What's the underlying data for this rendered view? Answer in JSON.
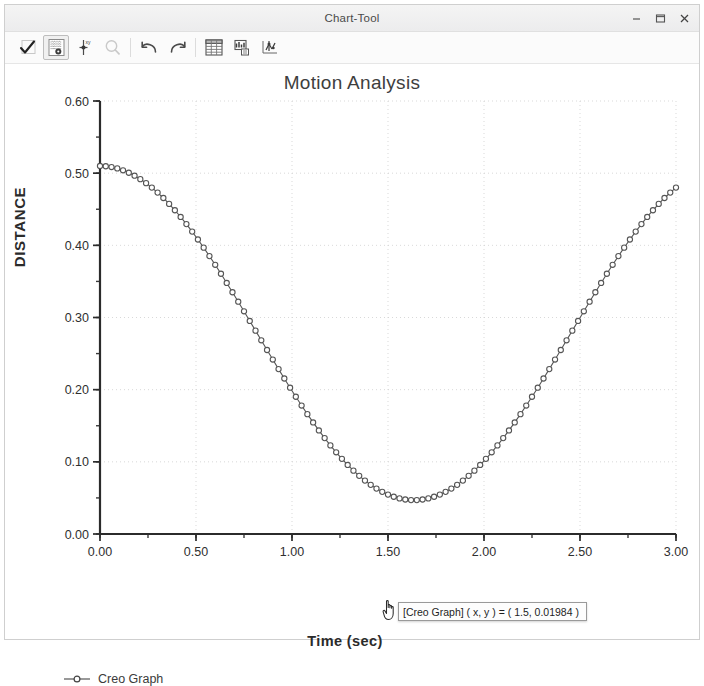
{
  "window": {
    "title": "Chart-Tool",
    "controls": [
      {
        "name": "minimize-button",
        "glyph": "minimize"
      },
      {
        "name": "maximize-button",
        "glyph": "maximize"
      },
      {
        "name": "close-button",
        "glyph": "close"
      }
    ]
  },
  "toolbar": {
    "buttons": [
      {
        "name": "accept-check-button",
        "icon": "checkmark-icon",
        "state": "normal"
      },
      {
        "name": "graph-display-settings-button",
        "icon": "grid-settings-icon",
        "state": "active"
      },
      {
        "name": "add-marker-button",
        "icon": "marker-pin-icon",
        "state": "normal"
      },
      {
        "name": "zoom-button",
        "icon": "magnifier-icon",
        "state": "disabled"
      },
      {
        "name": "undo-button",
        "icon": "undo-arrow-icon",
        "state": "normal"
      },
      {
        "name": "redo-button",
        "icon": "redo-arrow-icon",
        "state": "normal"
      },
      {
        "name": "show-table-button",
        "icon": "table-icon",
        "state": "normal"
      },
      {
        "name": "chart-format-button",
        "icon": "chart-format-icon",
        "state": "normal"
      },
      {
        "name": "export-data-button",
        "icon": "export-scatter-icon",
        "state": "normal"
      }
    ]
  },
  "chart_data": {
    "type": "line",
    "title": "Motion Analysis",
    "xlabel": "Time (sec)",
    "ylabel": "DISTANCE",
    "xlim": [
      0,
      3
    ],
    "ylim": [
      0,
      0.6
    ],
    "xticks": [
      "0.00",
      "0.50",
      "1.00",
      "1.50",
      "2.00",
      "2.50",
      "3.00"
    ],
    "xtick_values": [
      0,
      0.5,
      1,
      1.5,
      2,
      2.5,
      3
    ],
    "yticks": [
      "0.00",
      "0.10",
      "0.20",
      "0.30",
      "0.40",
      "0.50",
      "0.60"
    ],
    "ytick_values": [
      0,
      0.1,
      0.2,
      0.3,
      0.4,
      0.5,
      0.6
    ],
    "minor_tick_step_x": 0.25,
    "minor_tick_step_y": 0.05,
    "grid": true,
    "legend_position": "bottom-left",
    "marker": "open-circle",
    "series": [
      {
        "name": "Creo Graph",
        "color": "#555555",
        "x": [
          0.0,
          0.03,
          0.06,
          0.09,
          0.12,
          0.15,
          0.18,
          0.21,
          0.24,
          0.27,
          0.3,
          0.33,
          0.36,
          0.39,
          0.42,
          0.45,
          0.48,
          0.51,
          0.54,
          0.57,
          0.6,
          0.63,
          0.66,
          0.69,
          0.72,
          0.75,
          0.78,
          0.81,
          0.84,
          0.87,
          0.9,
          0.93,
          0.96,
          0.99,
          1.02,
          1.05,
          1.08,
          1.11,
          1.14,
          1.17,
          1.2,
          1.23,
          1.26,
          1.29,
          1.32,
          1.35,
          1.38,
          1.41,
          1.44,
          1.47,
          1.5,
          1.53,
          1.56,
          1.59,
          1.62,
          1.65,
          1.68,
          1.71,
          1.74,
          1.77,
          1.8,
          1.83,
          1.86,
          1.89,
          1.92,
          1.95,
          1.98,
          2.01,
          2.04,
          2.07,
          2.1,
          2.13,
          2.16,
          2.19,
          2.22,
          2.25,
          2.28,
          2.31,
          2.34,
          2.37,
          2.4,
          2.43,
          2.46,
          2.49,
          2.52,
          2.55,
          2.58,
          2.61,
          2.64,
          2.67,
          2.7,
          2.73,
          2.76,
          2.79,
          2.82,
          2.85,
          2.88,
          2.91,
          2.94,
          2.97,
          3.0
        ],
        "y": [
          0.51,
          0.5096,
          0.5085,
          0.5066,
          0.504,
          0.5006,
          0.4965,
          0.4917,
          0.4862,
          0.48,
          0.4731,
          0.4656,
          0.4574,
          0.4486,
          0.4393,
          0.4294,
          0.419,
          0.4081,
          0.3968,
          0.3851,
          0.373,
          0.3606,
          0.3479,
          0.335,
          0.3219,
          0.3086,
          0.2952,
          0.2818,
          0.2684,
          0.255,
          0.2417,
          0.2285,
          0.2155,
          0.2027,
          0.1902,
          0.178,
          0.1661,
          0.1546,
          0.1435,
          0.1329,
          0.1228,
          0.1132,
          0.1041,
          0.0957,
          0.0878,
          0.0806,
          0.074,
          0.0681,
          0.0629,
          0.0584,
          0.0546,
          0.0516,
          0.0493,
          0.0478,
          0.047,
          0.047,
          0.0478,
          0.0493,
          0.0516,
          0.0546,
          0.0584,
          0.0629,
          0.0681,
          0.074,
          0.0806,
          0.0878,
          0.0957,
          0.1041,
          0.1132,
          0.1228,
          0.1329,
          0.1435,
          0.1546,
          0.1661,
          0.178,
          0.1902,
          0.2027,
          0.2155,
          0.2285,
          0.2417,
          0.255,
          0.2684,
          0.2818,
          0.2952,
          0.3086,
          0.3219,
          0.335,
          0.3479,
          0.3606,
          0.373,
          0.3851,
          0.3968,
          0.4081,
          0.419,
          0.4294,
          0.4393,
          0.4486,
          0.4574,
          0.4656,
          0.4731,
          0.48
        ]
      }
    ]
  },
  "legend": {
    "entries": [
      {
        "label": "Creo Graph",
        "marker": "open-circle",
        "color": "#555555"
      }
    ]
  },
  "tooltip": {
    "text": "[Creo Graph] ( x, y ) = ( 1.5, 0.01984 )",
    "series": "Creo Graph",
    "x": "1.5",
    "y": "0.01984"
  },
  "cursor": {
    "type": "hand-pointer-cursor"
  }
}
